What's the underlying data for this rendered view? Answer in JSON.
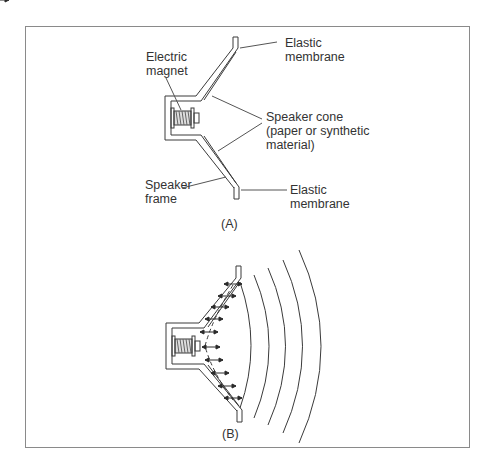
{
  "figure": {
    "panel_a": {
      "caption": "(A)",
      "labels": {
        "electric_magnet": "Electric\nmagnet",
        "elastic_membrane_top": "Elastic\nmembrane",
        "speaker_cone": "Speaker cone\n(paper or synthetic\nmaterial)",
        "speaker_frame": "Speaker\nframe",
        "elastic_membrane_bottom": "Elastic\nmembrane"
      }
    },
    "panel_b": {
      "caption": "(B)",
      "description": "Speaker cone vibrating, emitting sound waves as concentric arcs"
    },
    "colors": {
      "line": "#3a3a3a",
      "border": "#8a8a8a",
      "text": "#333333"
    }
  }
}
